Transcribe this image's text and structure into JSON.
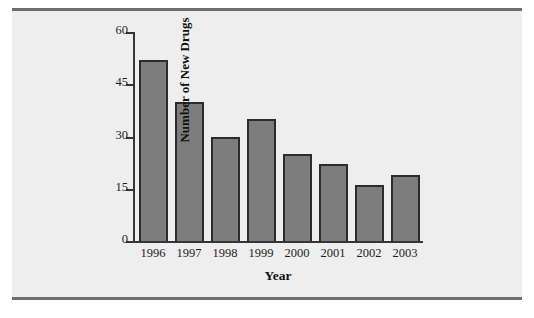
{
  "chart_data": {
    "type": "bar",
    "title": "",
    "subtitle": "",
    "xlabel": "Year",
    "ylabel": "Number of New Drugs",
    "categories": [
      "1996",
      "1997",
      "1998",
      "1999",
      "2000",
      "2001",
      "2002",
      "2003"
    ],
    "values": [
      52,
      40,
      30,
      35,
      25,
      22,
      16,
      19
    ],
    "series": [
      {
        "name": "Number of New Drugs",
        "values": [
          52,
          40,
          30,
          35,
          25,
          22,
          16,
          19
        ]
      }
    ],
    "ylim": [
      0,
      60
    ],
    "yticks": [
      0,
      15,
      30,
      45,
      60
    ],
    "ytick_labels": [
      "0",
      "15",
      "30",
      "45",
      "60"
    ],
    "grid": false,
    "legend": false,
    "legend_position": "none",
    "annotations": [],
    "colors": {
      "bar_fill": "#7d7d7d",
      "bar_border": "#2c2c30",
      "axis": "#35353a",
      "text": "#1d1d20",
      "panel_background": "#eeeeee",
      "rule": "#6e6e6e"
    }
  },
  "figure": {
    "top_rule": "",
    "bottom_rule": ""
  }
}
